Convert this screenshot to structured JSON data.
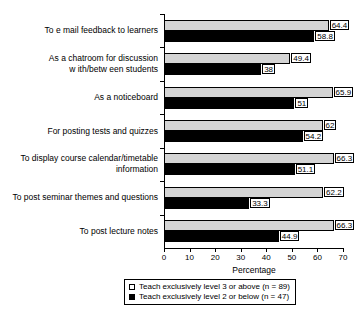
{
  "chart_data": {
    "type": "bar",
    "orientation": "horizontal",
    "title": "",
    "xlabel": "Percentage",
    "ylabel": "",
    "xlim": [
      0,
      70
    ],
    "xticks": [
      0,
      10,
      20,
      30,
      40,
      50,
      60,
      70
    ],
    "grid": false,
    "legend_position": "bottom",
    "categories": [
      "To e mail feedback to learners",
      "As a chatroom for discussion\nw ith/betw een students",
      "As a noticeboard",
      "For posting tests and quizzes",
      "To display course calendar/timetable\ninformation",
      "To post seminar themes and questions",
      "To post lecture notes"
    ],
    "series": [
      {
        "name": "Teach exclusively level 3 or above (n = 89)",
        "color": "#d4d4d4",
        "values": [
          64.4,
          49.4,
          65.9,
          62,
          66.3,
          62.2,
          66.3
        ],
        "value_labels": [
          "64.4",
          "49.4",
          "65.9",
          "62",
          "66.3",
          "62.2",
          "66.3"
        ]
      },
      {
        "name": "Teach exclusively level 2 or below  (n = 47)",
        "color": "#000000",
        "values": [
          58.8,
          38,
          51,
          54.2,
          51.1,
          33.3,
          44.9
        ],
        "value_labels": [
          "58.8",
          "38",
          "51",
          "54.2",
          "51.1",
          "33.3",
          "44.9"
        ]
      }
    ]
  }
}
